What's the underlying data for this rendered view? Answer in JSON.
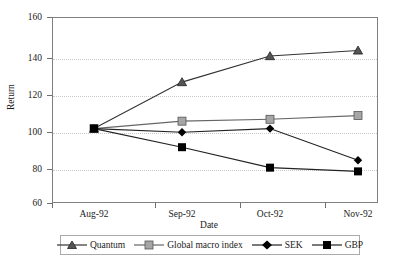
{
  "chart_data": {
    "type": "line",
    "title": "",
    "xlabel": "Date",
    "ylabel": "Return",
    "categories": [
      "Aug-92",
      "Sep-92",
      "Oct-92",
      "Nov-92"
    ],
    "ylim": [
      60,
      160
    ],
    "yticks": [
      60,
      80,
      100,
      120,
      140,
      160
    ],
    "grid": true,
    "legend_position": "bottom",
    "series": [
      {
        "name": "Quantum",
        "values": [
          100,
          125,
          139,
          142
        ],
        "marker": "triangle",
        "color": "#555555",
        "line_color": "#333333"
      },
      {
        "name": "Global macro index",
        "values": [
          100,
          104,
          105,
          107
        ],
        "marker": "square",
        "color": "#a6a6a6",
        "line_color": "#666666"
      },
      {
        "name": "SEK",
        "values": [
          100,
          98,
          100,
          83
        ],
        "marker": "diamond",
        "color": "#000000",
        "line_color": "#222222"
      },
      {
        "name": "GBP",
        "values": [
          100,
          90,
          79,
          77
        ],
        "marker": "square",
        "color": "#000000",
        "line_color": "#222222"
      }
    ]
  },
  "axes": {
    "y_tick_labels": [
      "160",
      "140",
      "120",
      "100",
      "80",
      "60"
    ],
    "y_title": "Return",
    "x_tick_labels": [
      "Aug-92",
      "Sep-92",
      "Oct-92",
      "Nov-92"
    ],
    "x_title": "Date"
  },
  "legend": {
    "items": [
      {
        "label": "Quantum"
      },
      {
        "label": "Global macro index"
      },
      {
        "label": "SEK"
      },
      {
        "label": "GBP"
      }
    ]
  },
  "colors": {
    "grid": "#c9c9c9",
    "frame": "#808080",
    "text": "#1a1a1a",
    "quantum": "#555555",
    "global_macro_index": "#a6a6a6",
    "sek": "#000000",
    "gbp": "#000000"
  }
}
